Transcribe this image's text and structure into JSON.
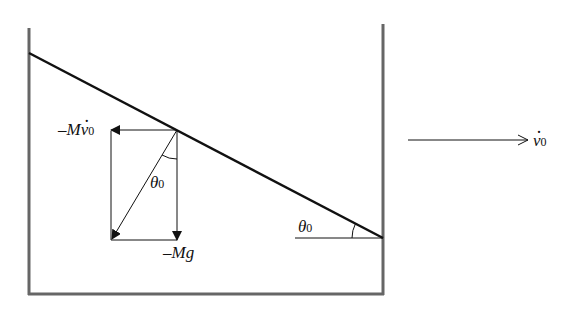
{
  "diagram": {
    "title": "",
    "labels": {
      "inertial_force": {
        "sign": "–",
        "symbol": "M",
        "var": "v",
        "sub": "0"
      },
      "gravity": {
        "text": "–Mg"
      },
      "angle_vector": {
        "symbol": "θ",
        "sub": "0"
      },
      "angle_incline": {
        "symbol": "θ",
        "sub": "0"
      },
      "velocity": {
        "var": "v",
        "sub": "0"
      }
    },
    "colors": {
      "stroke": "#111111",
      "wall": "#555555",
      "background": "#ffffff"
    }
  }
}
